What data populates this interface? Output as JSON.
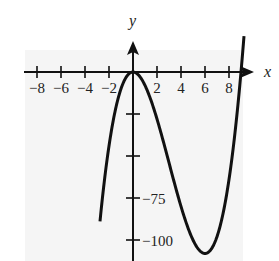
{
  "chart_data": {
    "type": "line",
    "title": "",
    "xlabel": "x",
    "ylabel": "y",
    "function": "y = x^2 (x - 9)",
    "x_ticks": [
      -8,
      -6,
      -4,
      -2,
      2,
      4,
      6,
      8
    ],
    "x_tick_labels": [
      "−8",
      "−6",
      "−4",
      "−2",
      "2",
      "4",
      "6",
      "8"
    ],
    "y_ticks": [
      -25,
      -50,
      -75,
      -100
    ],
    "y_tick_labels_shown": {
      "-75": "−75",
      "-100": "−100"
    },
    "xlim": [
      -9,
      9.5
    ],
    "ylim": [
      -110,
      25
    ],
    "grid": false,
    "key_points": [
      {
        "x": 0,
        "y": 0,
        "note": "local max"
      },
      {
        "x": 6,
        "y": -108,
        "note": "local min"
      },
      {
        "x": 9,
        "y": 0,
        "note": "root"
      }
    ],
    "series": [
      {
        "name": "f(x)",
        "x": [
          -2.6,
          -2,
          -1,
          0,
          1,
          2,
          3,
          4,
          5,
          6,
          7,
          8,
          9,
          9.2
        ],
        "values": [
          -78.4,
          -44,
          -10,
          0,
          -8,
          -28,
          -54,
          -80,
          -100,
          -108,
          -98,
          -64,
          0,
          8.5
        ]
      }
    ]
  },
  "labels": {
    "x_axis": "x",
    "y_axis": "y",
    "y75": "−75",
    "y100": "−100"
  }
}
